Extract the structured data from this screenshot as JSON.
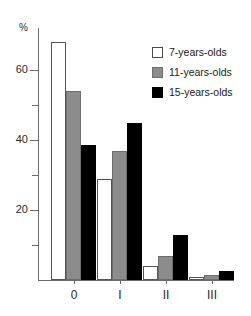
{
  "chart_data": {
    "type": "bar",
    "title": "",
    "subtitle": "",
    "xlabel": "",
    "ylabel": "%",
    "categories": [
      "0",
      "I",
      "II",
      "III"
    ],
    "series": [
      {
        "name": "7-years-olds",
        "color": "#ffffff",
        "values": [
          68,
          29,
          4,
          1
        ]
      },
      {
        "name": "11-years-olds",
        "color": "#8c8c8c",
        "values": [
          54,
          37,
          7,
          1.5
        ]
      },
      {
        "name": "15-years-olds",
        "color": "#000000",
        "values": [
          38.5,
          45,
          13,
          2.5
        ]
      }
    ],
    "ylim": [
      0,
      72
    ],
    "yticks": [
      10,
      20,
      30,
      40,
      50,
      60
    ],
    "ytick_labels": [
      "",
      "20",
      "",
      "40",
      "",
      "60"
    ],
    "grid": false,
    "legend_position": "top-right"
  },
  "axes": {
    "unit_label": "%",
    "y_ticks": [
      {
        "value": 60,
        "label": "60",
        "major": true
      },
      {
        "value": 50,
        "label": "",
        "major": false
      },
      {
        "value": 40,
        "label": "40",
        "major": true
      },
      {
        "value": 30,
        "label": "",
        "major": false
      },
      {
        "value": 20,
        "label": "20",
        "major": true
      },
      {
        "value": 10,
        "label": "",
        "major": false
      }
    ],
    "x_ticks": [
      {
        "label": "0"
      },
      {
        "label": "I"
      },
      {
        "label": "II"
      },
      {
        "label": "III"
      }
    ]
  },
  "legend": {
    "items": [
      {
        "label": "7-years-olds",
        "swatch": "white"
      },
      {
        "label": "11-years-olds",
        "swatch": "gray"
      },
      {
        "label": "15-years-olds",
        "swatch": "black"
      }
    ]
  }
}
